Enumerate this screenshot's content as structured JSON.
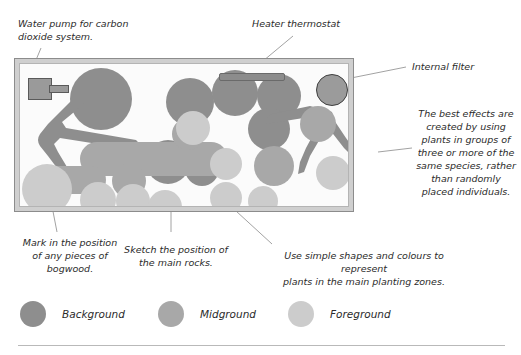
{
  "annotations": {
    "water_pump": "Water pump for carbon\n    dioxide system.",
    "heater": "Heater thermostat",
    "internal_filter": "Internal filter",
    "best_effects": "The best effects are\ncreated by using\nplants in groups of\nthree or more of the\nsame species, rather\nthan randomly\nplaced individuals.",
    "bogwood": "Mark in the position\nof any pieces of\nbogwood.",
    "rocks": "Sketch the position of\nthe main rocks.",
    "planting": "Use simple shapes and colours to represent\nplants in the main planting zones."
  },
  "legend": {
    "items": [
      {
        "label": "Background",
        "color": "#8e8e8e"
      },
      {
        "label": "Midground",
        "color": "#a8a8a8"
      },
      {
        "label": "Foreground",
        "color": "#cccccc"
      }
    ]
  },
  "tank": {
    "frame_color": "#cfcfcf",
    "interior_color": "#fbfbfb",
    "equipment": {
      "pump_label": "water-pump",
      "heater_label": "heater-thermostat",
      "filter_label": "internal-filter"
    }
  },
  "colors": {
    "background_zone": "#8e8e8e",
    "midground_zone": "#a8a8a8",
    "foreground_zone": "#cccccc",
    "text": "#2b2b2b",
    "leader_line": "#8a8a8a"
  }
}
